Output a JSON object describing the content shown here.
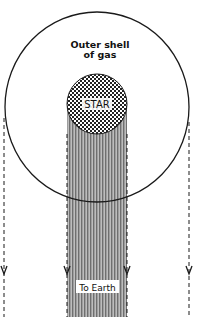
{
  "diagram": {
    "labels": {
      "outer_shell_line1": "Outer shell",
      "outer_shell_line2": "of gas",
      "star": "STAR",
      "to_earth": "To Earth"
    },
    "elements": {
      "outer_shell": {
        "shape": "circle",
        "cx": 97,
        "cy": 107,
        "rx": 92,
        "ry": 95
      },
      "star": {
        "shape": "circle",
        "cx": 97,
        "cy": 104,
        "r": 30,
        "fill_pattern": "checker-dots"
      },
      "light_column": {
        "x": 67,
        "y": 104,
        "width": 60,
        "height": 213,
        "fill_pattern": "vertical-stripes"
      },
      "dashed_rays": [
        {
          "side": "left-outer",
          "x": 4,
          "y_start": 118,
          "y_end": 317
        },
        {
          "side": "left-column",
          "x": 67,
          "y_start": 134,
          "y_end": 317
        },
        {
          "side": "right-column",
          "x": 127,
          "y_start": 134,
          "y_end": 317
        },
        {
          "side": "right-outer",
          "x": 189,
          "y_start": 122,
          "y_end": 317
        }
      ],
      "arrow_y": 270
    },
    "colors": {
      "line": "#1a1a1a",
      "stripe_dark": "#7a7a7a",
      "stripe_light": "#b8b8b8",
      "background": "#ffffff"
    }
  }
}
